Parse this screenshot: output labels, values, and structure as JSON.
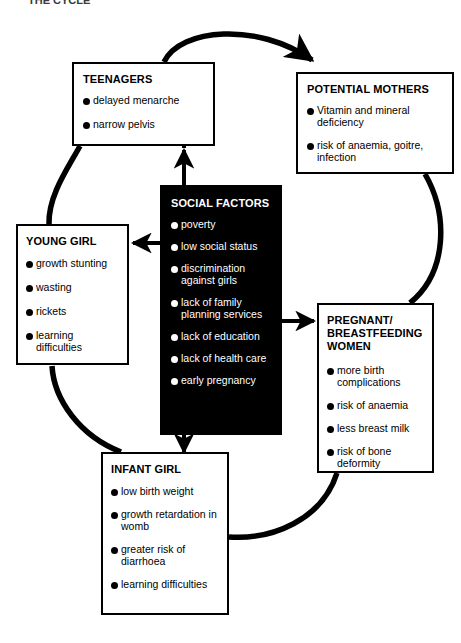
{
  "page": {
    "caption": "THE CYCLE",
    "background_color": "#ffffff",
    "line_color": "#000000",
    "inverted_box_color": "#000000",
    "inverted_text_color": "#ffffff"
  },
  "diagram": {
    "type": "cycle-flow-diagram",
    "nodes": [
      {
        "id": "teenagers",
        "title": "TEENAGERS",
        "style": "outlined",
        "items": [
          "delayed menarche",
          "narrow pelvis"
        ]
      },
      {
        "id": "potential-mothers",
        "title": "POTENTIAL MOTHERS",
        "style": "outlined",
        "items": [
          "Vitamin and mineral deficiency",
          "risk of anaemia, goitre, infection"
        ]
      },
      {
        "id": "young-girl",
        "title": "YOUNG GIRL",
        "style": "outlined",
        "items": [
          "growth stunting",
          "wasting",
          "rickets",
          "learning difficulties"
        ]
      },
      {
        "id": "social-factors",
        "title": "SOCIAL FACTORS",
        "style": "inverted",
        "items": [
          "poverty",
          "low social status",
          "discrimination against girls",
          "lack of family planning services",
          "lack of education",
          "lack of health care",
          "early pregnancy"
        ]
      },
      {
        "id": "pregnant-breastfeeding-women",
        "title": "PREGNANT/ BREASTFEEDING WOMEN",
        "style": "outlined",
        "items": [
          "more birth complications",
          "risk of anaemia",
          "less breast milk",
          "risk of bone deformity"
        ]
      },
      {
        "id": "infant-girl",
        "title": "INFANT GIRL",
        "style": "outlined",
        "items": [
          "low birth weight",
          "growth retardation in womb",
          "greater risk of diarrhoea",
          "learning difficulties"
        ]
      }
    ],
    "connectors": [
      {
        "id": "infant-to-young",
        "from": "infant-girl",
        "to": "young-girl",
        "shape": "curve",
        "arrowhead": true
      },
      {
        "id": "young-to-teenagers",
        "from": "young-girl",
        "to": "teenagers",
        "shape": "curve",
        "arrowhead": true
      },
      {
        "id": "teenagers-to-potential-mothers",
        "from": "teenagers",
        "to": "potential-mothers",
        "shape": "curve",
        "arrowhead": true
      },
      {
        "id": "potential-mothers-to-pregnant",
        "from": "potential-mothers",
        "to": "pregnant-breastfeeding-women",
        "shape": "curve",
        "arrowhead": true
      },
      {
        "id": "pregnant-to-infant",
        "from": "pregnant-breastfeeding-women",
        "to": "infant-girl",
        "shape": "curve",
        "arrowhead": true
      },
      {
        "id": "social-to-teenagers",
        "from": "social-factors",
        "to": "teenagers",
        "shape": "straight-up",
        "arrowhead": true
      },
      {
        "id": "social-to-young-girl",
        "from": "social-factors",
        "to": "young-girl",
        "shape": "straight-left",
        "arrowhead": true
      },
      {
        "id": "social-to-pregnant",
        "from": "social-factors",
        "to": "pregnant-breastfeeding-women",
        "shape": "straight-right",
        "arrowhead": true
      },
      {
        "id": "social-to-infant-girl",
        "from": "social-factors",
        "to": "infant-girl",
        "shape": "straight-down",
        "arrowhead": true
      }
    ]
  }
}
